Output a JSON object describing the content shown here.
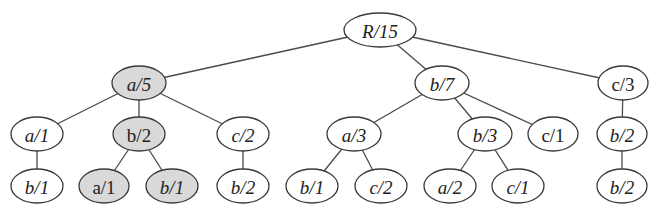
{
  "diagram": {
    "type": "tree",
    "colors": {
      "highlight_fill": "#d9d9d9",
      "normal_fill": "#ffffff",
      "stroke": "#3a3a3a",
      "edge": "#4a4a4a"
    },
    "nodes": [
      {
        "id": "root",
        "label": "R/15",
        "italic": true,
        "highlighted": false,
        "x": 380,
        "y": 30,
        "rx": 36,
        "ry": 17
      },
      {
        "id": "a5",
        "label": "a/5",
        "italic": true,
        "highlighted": true,
        "x": 139,
        "y": 83,
        "rx": 27,
        "ry": 17
      },
      {
        "id": "b7",
        "label": "b/7",
        "italic": true,
        "highlighted": false,
        "x": 442,
        "y": 83,
        "rx": 27,
        "ry": 17
      },
      {
        "id": "c3",
        "label": "c/3",
        "italic": false,
        "highlighted": false,
        "x": 623,
        "y": 83,
        "rx": 25,
        "ry": 17
      },
      {
        "id": "a1",
        "label": "a/1",
        "italic": true,
        "highlighted": false,
        "x": 37,
        "y": 134,
        "rx": 26,
        "ry": 17
      },
      {
        "id": "b2s",
        "label": "b/2",
        "italic": false,
        "highlighted": true,
        "x": 139,
        "y": 134,
        "rx": 26,
        "ry": 17
      },
      {
        "id": "c2",
        "label": "c/2",
        "italic": true,
        "highlighted": false,
        "x": 243,
        "y": 134,
        "rx": 26,
        "ry": 17
      },
      {
        "id": "a3",
        "label": "a/3",
        "italic": true,
        "highlighted": false,
        "x": 354,
        "y": 134,
        "rx": 27,
        "ry": 17
      },
      {
        "id": "b3",
        "label": "b/3",
        "italic": true,
        "highlighted": false,
        "x": 485,
        "y": 134,
        "rx": 27,
        "ry": 17
      },
      {
        "id": "c1",
        "label": "c/1",
        "italic": false,
        "highlighted": false,
        "x": 553,
        "y": 134,
        "rx": 25,
        "ry": 17
      },
      {
        "id": "b2r",
        "label": "b/2",
        "italic": true,
        "highlighted": false,
        "x": 622,
        "y": 134,
        "rx": 25,
        "ry": 17
      },
      {
        "id": "b1a",
        "label": "b/1",
        "italic": true,
        "highlighted": false,
        "x": 37,
        "y": 186,
        "rx": 26,
        "ry": 17
      },
      {
        "id": "a1s",
        "label": "a/1",
        "italic": false,
        "highlighted": true,
        "x": 104,
        "y": 186,
        "rx": 25,
        "ry": 17
      },
      {
        "id": "b1s",
        "label": "b/1",
        "italic": true,
        "highlighted": true,
        "x": 172,
        "y": 186,
        "rx": 26,
        "ry": 17
      },
      {
        "id": "b2c",
        "label": "b/2",
        "italic": true,
        "highlighted": false,
        "x": 243,
        "y": 186,
        "rx": 26,
        "ry": 17
      },
      {
        "id": "b1b",
        "label": "b/1",
        "italic": true,
        "highlighted": false,
        "x": 312,
        "y": 186,
        "rx": 26,
        "ry": 17
      },
      {
        "id": "c2b",
        "label": "c/2",
        "italic": true,
        "highlighted": false,
        "x": 381,
        "y": 186,
        "rx": 26,
        "ry": 17
      },
      {
        "id": "a2",
        "label": "a/2",
        "italic": true,
        "highlighted": false,
        "x": 450,
        "y": 186,
        "rx": 26,
        "ry": 17
      },
      {
        "id": "c1b",
        "label": "c/1",
        "italic": true,
        "highlighted": false,
        "x": 518,
        "y": 186,
        "rx": 26,
        "ry": 17
      },
      {
        "id": "b2rr",
        "label": "b/2",
        "italic": true,
        "highlighted": false,
        "x": 622,
        "y": 186,
        "rx": 25,
        "ry": 17
      }
    ],
    "edges": [
      [
        "root",
        "a5"
      ],
      [
        "root",
        "b7"
      ],
      [
        "root",
        "c3"
      ],
      [
        "a5",
        "a1"
      ],
      [
        "a5",
        "b2s"
      ],
      [
        "a5",
        "c2"
      ],
      [
        "b7",
        "a3"
      ],
      [
        "b7",
        "b3"
      ],
      [
        "b7",
        "c1"
      ],
      [
        "c3",
        "b2r"
      ],
      [
        "a1",
        "b1a"
      ],
      [
        "b2s",
        "a1s"
      ],
      [
        "b2s",
        "b1s"
      ],
      [
        "c2",
        "b2c"
      ],
      [
        "a3",
        "b1b"
      ],
      [
        "a3",
        "c2b"
      ],
      [
        "b3",
        "a2"
      ],
      [
        "b3",
        "c1b"
      ],
      [
        "b2r",
        "b2rr"
      ]
    ]
  }
}
